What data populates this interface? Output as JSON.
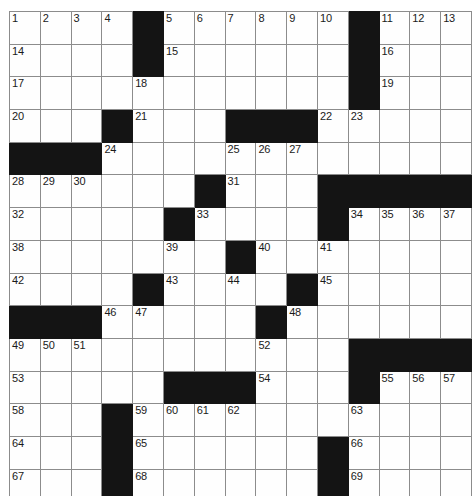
{
  "puzzle": {
    "type": "crossword-grid",
    "rows": 15,
    "cols": 15,
    "colors": {
      "block": "#141414",
      "cell": "#fefefe",
      "gridline": "#8c8c8c",
      "border": "#4a4a4a",
      "number": "#1a1a1a",
      "page_background": "#ffffff"
    },
    "cells": [
      [
        {
          "black": false,
          "num": "1"
        },
        {
          "black": false,
          "num": "2"
        },
        {
          "black": false,
          "num": "3"
        },
        {
          "black": false,
          "num": "4"
        },
        {
          "black": true,
          "num": ""
        },
        {
          "black": false,
          "num": "5"
        },
        {
          "black": false,
          "num": "6"
        },
        {
          "black": false,
          "num": "7"
        },
        {
          "black": false,
          "num": "8"
        },
        {
          "black": false,
          "num": "9"
        },
        {
          "black": false,
          "num": "10"
        },
        {
          "black": true,
          "num": ""
        },
        {
          "black": false,
          "num": "11"
        },
        {
          "black": false,
          "num": "12"
        },
        {
          "black": false,
          "num": "13"
        }
      ],
      [
        {
          "black": false,
          "num": "14"
        },
        {
          "black": false,
          "num": ""
        },
        {
          "black": false,
          "num": ""
        },
        {
          "black": false,
          "num": ""
        },
        {
          "black": true,
          "num": ""
        },
        {
          "black": false,
          "num": "15"
        },
        {
          "black": false,
          "num": ""
        },
        {
          "black": false,
          "num": ""
        },
        {
          "black": false,
          "num": ""
        },
        {
          "black": false,
          "num": ""
        },
        {
          "black": false,
          "num": ""
        },
        {
          "black": true,
          "num": ""
        },
        {
          "black": false,
          "num": "16"
        },
        {
          "black": false,
          "num": ""
        },
        {
          "black": false,
          "num": ""
        }
      ],
      [
        {
          "black": false,
          "num": "17"
        },
        {
          "black": false,
          "num": ""
        },
        {
          "black": false,
          "num": ""
        },
        {
          "black": false,
          "num": ""
        },
        {
          "black": false,
          "num": "18"
        },
        {
          "black": false,
          "num": ""
        },
        {
          "black": false,
          "num": ""
        },
        {
          "black": false,
          "num": ""
        },
        {
          "black": false,
          "num": ""
        },
        {
          "black": false,
          "num": ""
        },
        {
          "black": false,
          "num": ""
        },
        {
          "black": true,
          "num": ""
        },
        {
          "black": false,
          "num": "19"
        },
        {
          "black": false,
          "num": ""
        },
        {
          "black": false,
          "num": ""
        }
      ],
      [
        {
          "black": false,
          "num": "20"
        },
        {
          "black": false,
          "num": ""
        },
        {
          "black": false,
          "num": ""
        },
        {
          "black": true,
          "num": ""
        },
        {
          "black": false,
          "num": "21"
        },
        {
          "black": false,
          "num": ""
        },
        {
          "black": false,
          "num": ""
        },
        {
          "black": true,
          "num": ""
        },
        {
          "black": true,
          "num": ""
        },
        {
          "black": true,
          "num": ""
        },
        {
          "black": false,
          "num": "22"
        },
        {
          "black": false,
          "num": "23"
        },
        {
          "black": false,
          "num": ""
        },
        {
          "black": false,
          "num": ""
        },
        {
          "black": false,
          "num": ""
        }
      ],
      [
        {
          "black": true,
          "num": ""
        },
        {
          "black": true,
          "num": ""
        },
        {
          "black": true,
          "num": ""
        },
        {
          "black": false,
          "num": "24"
        },
        {
          "black": false,
          "num": ""
        },
        {
          "black": false,
          "num": ""
        },
        {
          "black": false,
          "num": ""
        },
        {
          "black": false,
          "num": "25"
        },
        {
          "black": false,
          "num": "26"
        },
        {
          "black": false,
          "num": "27"
        },
        {
          "black": false,
          "num": ""
        },
        {
          "black": false,
          "num": ""
        },
        {
          "black": false,
          "num": ""
        },
        {
          "black": false,
          "num": ""
        },
        {
          "black": false,
          "num": ""
        }
      ],
      [
        {
          "black": false,
          "num": "28"
        },
        {
          "black": false,
          "num": "29"
        },
        {
          "black": false,
          "num": "30"
        },
        {
          "black": false,
          "num": ""
        },
        {
          "black": false,
          "num": ""
        },
        {
          "black": false,
          "num": ""
        },
        {
          "black": true,
          "num": ""
        },
        {
          "black": false,
          "num": "31"
        },
        {
          "black": false,
          "num": ""
        },
        {
          "black": false,
          "num": ""
        },
        {
          "black": true,
          "num": ""
        },
        {
          "black": true,
          "num": ""
        },
        {
          "black": true,
          "num": ""
        },
        {
          "black": true,
          "num": ""
        },
        {
          "black": true,
          "num": ""
        }
      ],
      [
        {
          "black": false,
          "num": "32"
        },
        {
          "black": false,
          "num": ""
        },
        {
          "black": false,
          "num": ""
        },
        {
          "black": false,
          "num": ""
        },
        {
          "black": false,
          "num": ""
        },
        {
          "black": true,
          "num": ""
        },
        {
          "black": false,
          "num": "33"
        },
        {
          "black": false,
          "num": ""
        },
        {
          "black": false,
          "num": ""
        },
        {
          "black": false,
          "num": ""
        },
        {
          "black": true,
          "num": ""
        },
        {
          "black": false,
          "num": "34"
        },
        {
          "black": false,
          "num": "35"
        },
        {
          "black": false,
          "num": "36"
        },
        {
          "black": false,
          "num": "37"
        }
      ],
      [
        {
          "black": false,
          "num": "38"
        },
        {
          "black": false,
          "num": ""
        },
        {
          "black": false,
          "num": ""
        },
        {
          "black": false,
          "num": ""
        },
        {
          "black": false,
          "num": ""
        },
        {
          "black": false,
          "num": "39"
        },
        {
          "black": false,
          "num": ""
        },
        {
          "black": true,
          "num": ""
        },
        {
          "black": false,
          "num": "40"
        },
        {
          "black": false,
          "num": ""
        },
        {
          "black": false,
          "num": "41"
        },
        {
          "black": false,
          "num": ""
        },
        {
          "black": false,
          "num": ""
        },
        {
          "black": false,
          "num": ""
        },
        {
          "black": false,
          "num": ""
        }
      ],
      [
        {
          "black": false,
          "num": "42"
        },
        {
          "black": false,
          "num": ""
        },
        {
          "black": false,
          "num": ""
        },
        {
          "black": false,
          "num": ""
        },
        {
          "black": true,
          "num": ""
        },
        {
          "black": false,
          "num": "43"
        },
        {
          "black": false,
          "num": ""
        },
        {
          "black": false,
          "num": "44"
        },
        {
          "black": false,
          "num": ""
        },
        {
          "black": true,
          "num": ""
        },
        {
          "black": false,
          "num": "45"
        },
        {
          "black": false,
          "num": ""
        },
        {
          "black": false,
          "num": ""
        },
        {
          "black": false,
          "num": ""
        },
        {
          "black": false,
          "num": ""
        }
      ],
      [
        {
          "black": true,
          "num": ""
        },
        {
          "black": true,
          "num": ""
        },
        {
          "black": true,
          "num": ""
        },
        {
          "black": false,
          "num": "46"
        },
        {
          "black": false,
          "num": "47"
        },
        {
          "black": false,
          "num": ""
        },
        {
          "black": false,
          "num": ""
        },
        {
          "black": false,
          "num": ""
        },
        {
          "black": true,
          "num": ""
        },
        {
          "black": false,
          "num": "48"
        },
        {
          "black": false,
          "num": ""
        },
        {
          "black": false,
          "num": ""
        },
        {
          "black": false,
          "num": ""
        },
        {
          "black": false,
          "num": ""
        },
        {
          "black": false,
          "num": ""
        }
      ],
      [
        {
          "black": false,
          "num": "49"
        },
        {
          "black": false,
          "num": "50"
        },
        {
          "black": false,
          "num": "51"
        },
        {
          "black": false,
          "num": ""
        },
        {
          "black": false,
          "num": ""
        },
        {
          "black": false,
          "num": ""
        },
        {
          "black": false,
          "num": ""
        },
        {
          "black": false,
          "num": ""
        },
        {
          "black": false,
          "num": "52"
        },
        {
          "black": false,
          "num": ""
        },
        {
          "black": false,
          "num": ""
        },
        {
          "black": true,
          "num": ""
        },
        {
          "black": true,
          "num": ""
        },
        {
          "black": true,
          "num": ""
        },
        {
          "black": true,
          "num": ""
        }
      ],
      [
        {
          "black": false,
          "num": "53"
        },
        {
          "black": false,
          "num": ""
        },
        {
          "black": false,
          "num": ""
        },
        {
          "black": false,
          "num": ""
        },
        {
          "black": false,
          "num": ""
        },
        {
          "black": true,
          "num": ""
        },
        {
          "black": true,
          "num": ""
        },
        {
          "black": true,
          "num": ""
        },
        {
          "black": false,
          "num": "54"
        },
        {
          "black": false,
          "num": ""
        },
        {
          "black": false,
          "num": ""
        },
        {
          "black": true,
          "num": ""
        },
        {
          "black": false,
          "num": "55"
        },
        {
          "black": false,
          "num": "56"
        },
        {
          "black": false,
          "num": "57"
        }
      ],
      [
        {
          "black": false,
          "num": "58"
        },
        {
          "black": false,
          "num": ""
        },
        {
          "black": false,
          "num": ""
        },
        {
          "black": true,
          "num": ""
        },
        {
          "black": false,
          "num": "59"
        },
        {
          "black": false,
          "num": "60"
        },
        {
          "black": false,
          "num": "61"
        },
        {
          "black": false,
          "num": "62"
        },
        {
          "black": false,
          "num": ""
        },
        {
          "black": false,
          "num": ""
        },
        {
          "black": false,
          "num": ""
        },
        {
          "black": false,
          "num": "63"
        },
        {
          "black": false,
          "num": ""
        },
        {
          "black": false,
          "num": ""
        },
        {
          "black": false,
          "num": ""
        }
      ],
      [
        {
          "black": false,
          "num": "64"
        },
        {
          "black": false,
          "num": ""
        },
        {
          "black": false,
          "num": ""
        },
        {
          "black": true,
          "num": ""
        },
        {
          "black": false,
          "num": "65"
        },
        {
          "black": false,
          "num": ""
        },
        {
          "black": false,
          "num": ""
        },
        {
          "black": false,
          "num": ""
        },
        {
          "black": false,
          "num": ""
        },
        {
          "black": false,
          "num": ""
        },
        {
          "black": true,
          "num": ""
        },
        {
          "black": false,
          "num": "66"
        },
        {
          "black": false,
          "num": ""
        },
        {
          "black": false,
          "num": ""
        },
        {
          "black": false,
          "num": ""
        }
      ],
      [
        {
          "black": false,
          "num": "67"
        },
        {
          "black": false,
          "num": ""
        },
        {
          "black": false,
          "num": ""
        },
        {
          "black": true,
          "num": ""
        },
        {
          "black": false,
          "num": "68"
        },
        {
          "black": false,
          "num": ""
        },
        {
          "black": false,
          "num": ""
        },
        {
          "black": false,
          "num": ""
        },
        {
          "black": false,
          "num": ""
        },
        {
          "black": false,
          "num": ""
        },
        {
          "black": true,
          "num": ""
        },
        {
          "black": false,
          "num": "69"
        },
        {
          "black": false,
          "num": ""
        },
        {
          "black": false,
          "num": ""
        },
        {
          "black": false,
          "num": ""
        }
      ]
    ]
  }
}
